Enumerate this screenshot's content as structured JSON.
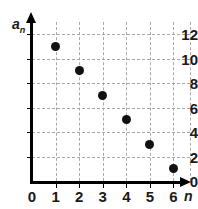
{
  "chart_data": {
    "type": "scatter",
    "title": "",
    "xlabel": "n",
    "ylabel": "a_n",
    "ylabel_display": "a",
    "ylabel_subscript": "n",
    "x": [
      1,
      2,
      3,
      4,
      5,
      6
    ],
    "values": [
      11,
      9,
      7,
      5,
      3,
      1
    ],
    "points": [
      {
        "x": 1,
        "y": 11
      },
      {
        "x": 2,
        "y": 9
      },
      {
        "x": 3,
        "y": 7
      },
      {
        "x": 4,
        "y": 5
      },
      {
        "x": 5,
        "y": 3
      },
      {
        "x": 6,
        "y": 1
      }
    ],
    "xlim": [
      0,
      6.7
    ],
    "ylim": [
      0,
      13
    ],
    "xticks": [
      0,
      1,
      2,
      3,
      4,
      5,
      6
    ],
    "xtick_labels": [
      "0",
      "1",
      "2",
      "3",
      "4",
      "5",
      "6"
    ],
    "yticks": [
      0,
      2,
      4,
      6,
      8,
      10,
      12
    ],
    "ytick_labels": [
      "0",
      "2",
      "4",
      "6",
      "8",
      "10",
      "12"
    ],
    "grid": true,
    "grid_style": "dashed",
    "grid_color": "#a8a8a8",
    "point_color": "#111111",
    "axis_color": "#000000",
    "legend": null,
    "annotations": []
  },
  "artifact": {
    "clipped_glyph": ".."
  }
}
